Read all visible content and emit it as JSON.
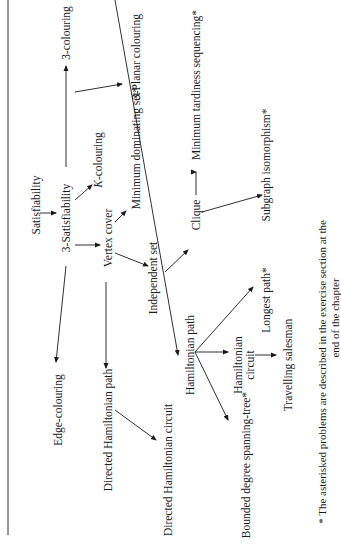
{
  "diagram": {
    "nodes": {
      "satisfiability": "Satisfiability",
      "three_sat": "3-Satisfiability",
      "edge_colouring": "Edge-colouring",
      "three_colouring": "3-colouring",
      "three_planar_colouring": "3-Planar colouring",
      "k_colouring": "K-colouring",
      "vertex_cover": "Vertex cover",
      "min_dominating_set": "Minimum dominating set*",
      "independent_set": "Independent set",
      "clique": "Clique",
      "min_tardiness": "Minimum tardiness sequencing*",
      "subgraph_iso": "Subgraph isomorphism*",
      "directed_ham_path": "Directed Hamiltonian path",
      "directed_ham_circuit": "Directed Hamiltonian circuit",
      "ham_path": "Hamiltonian path",
      "longest_path": "Longest path*",
      "ham_circuit_1": "Hamiltonian",
      "ham_circuit_2": "circuit",
      "travelling_salesman": "Travelling salesman",
      "bounded_degree": "Bounded degree spanning-tree*"
    },
    "edges": [
      [
        "Satisfiability",
        "3-Satisfiability"
      ],
      [
        "3-Satisfiability",
        "3-colouring"
      ],
      [
        "3-Satisfiability",
        "Edge-colouring"
      ],
      [
        "3-Satisfiability",
        "K-colouring"
      ],
      [
        "3-Satisfiability",
        "Vertex cover"
      ],
      [
        "3-colouring",
        "3-Planar colouring"
      ],
      [
        "Vertex cover",
        "Minimum dominating set*"
      ],
      [
        "Vertex cover",
        "Independent set"
      ],
      [
        "Vertex cover",
        "Directed Hamiltonian path"
      ],
      [
        "Independent set",
        "Clique"
      ],
      [
        "Clique",
        "Minimum tardiness sequencing*"
      ],
      [
        "Clique",
        "Subgraph isomorphism*"
      ],
      [
        "Directed Hamiltonian path",
        "Directed Hamiltonian circuit"
      ],
      [
        "Directed Hamiltonian path",
        "Hamiltonian path"
      ],
      [
        "Hamiltonian path",
        "Longest path*"
      ],
      [
        "Hamiltonian path",
        "Hamiltonian circuit"
      ],
      [
        "Hamiltonian path",
        "Bounded degree spanning-tree*"
      ],
      [
        "Hamiltonian circuit",
        "Travelling salesman"
      ]
    ],
    "footnote_line1": "* The asterisked problems are described in the exercise section at the",
    "footnote_line2": "end of the chapter"
  }
}
